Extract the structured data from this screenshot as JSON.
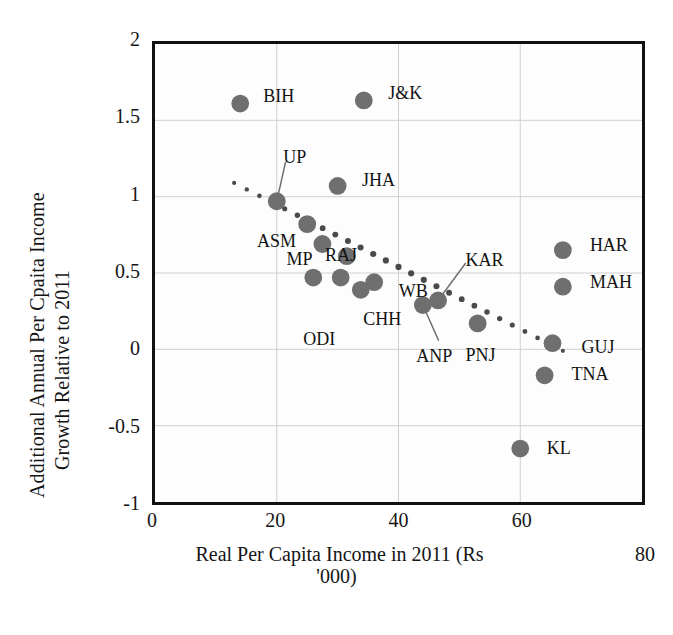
{
  "chart_data": {
    "type": "scatter",
    "title": "",
    "xlabel": "Real Per Capita Income in 2011 (Rs '000)",
    "xlabel_line1": "Real Per Capita Income in 2011 (Rs",
    "xlabel_line2": "'000)",
    "ylabel": "Additional Annual Per Cpaita Income Growth Relative to 2011",
    "ylabel_line1": "Additional Annual Per Cpaita Income",
    "ylabel_line2": "Growth Relative to 2011",
    "xlim": [
      0,
      80
    ],
    "ylim": [
      -1,
      2
    ],
    "xticks": [
      0,
      20,
      40,
      60,
      80
    ],
    "xtick_labels": [
      "0",
      "20",
      "40",
      "60",
      "80"
    ],
    "yticks": [
      -1,
      -0.5,
      0,
      0.5,
      1,
      1.5,
      2
    ],
    "ytick_labels": [
      "-1",
      "-0.5",
      "0",
      "0.5",
      "1",
      "1.5",
      "2"
    ],
    "grid": true,
    "legend": "none",
    "marker_color": "#6f6f6f",
    "trendline_color": "#4a4a4a",
    "trendline_style": "dotted",
    "trendline": {
      "x0": 13.0,
      "y0": 1.09,
      "x1": 67.0,
      "y1": -0.01
    },
    "points": [
      {
        "label": "BIH",
        "x": 14.0,
        "y": 1.61,
        "label_dx": 22,
        "label_dy": -8,
        "leader": false
      },
      {
        "label": "J&K",
        "x": 34.3,
        "y": 1.63,
        "label_dx": 22,
        "label_dy": -8,
        "leader": false
      },
      {
        "label": "UP",
        "x": 20.0,
        "y": 0.97,
        "label_dx": 5,
        "label_dy": -46,
        "leader": true
      },
      {
        "label": "JHA",
        "x": 30.0,
        "y": 1.07,
        "label_dx": 22,
        "label_dy": -8,
        "leader": false
      },
      {
        "label": "ASM",
        "x": 25.0,
        "y": 0.82,
        "label_dx": -52,
        "label_dy": 14,
        "leader": false
      },
      {
        "label": "MP",
        "x": 27.5,
        "y": 0.69,
        "label_dx": -38,
        "label_dy": 12,
        "leader": false
      },
      {
        "label": "RAJ",
        "x": 31.5,
        "y": 0.61,
        "label_dx": -24,
        "label_dy": -4,
        "leader": false
      },
      {
        "label": "ODI",
        "x": 26.0,
        "y": 0.47,
        "label_dx": -12,
        "label_dy": 58,
        "leader": false
      },
      {
        "label": "ODI2",
        "x": 30.5,
        "y": 0.47,
        "label_dx": -38,
        "label_dy": 46,
        "leader": true
      },
      {
        "label": "CHH",
        "x": 33.8,
        "y": 0.39,
        "label_dx": 0,
        "label_dy": 26,
        "leader": false
      },
      {
        "label": "WB",
        "x": 36.0,
        "y": 0.44,
        "label_dx": 22,
        "label_dy": 6,
        "leader": false
      },
      {
        "label": "ANP",
        "x": 44.0,
        "y": 0.29,
        "label_dx": -10,
        "label_dy": 48,
        "leader": true
      },
      {
        "label": "KAR",
        "x": 46.5,
        "y": 0.32,
        "label_dx": 24,
        "label_dy": -44,
        "leader": true
      },
      {
        "label": "PNJ",
        "x": 53.0,
        "y": 0.17,
        "label_dx": -16,
        "label_dy": 28,
        "leader": false
      },
      {
        "label": "GUJ",
        "x": 65.3,
        "y": 0.04,
        "label_dx": 24,
        "label_dy": 0,
        "leader": false
      },
      {
        "label": "TNA",
        "x": 64.0,
        "y": -0.17,
        "label_dx": 22,
        "label_dy": -6,
        "leader": false
      },
      {
        "label": "KL",
        "x": 60.0,
        "y": -0.65,
        "label_dx": 22,
        "label_dy": -6,
        "leader": false
      },
      {
        "label": "HAR",
        "x": 67.0,
        "y": 0.65,
        "label_dx": 22,
        "label_dy": -8,
        "leader": false
      },
      {
        "label": "MAH",
        "x": 67.0,
        "y": 0.41,
        "label_dx": 22,
        "label_dy": -8,
        "leader": false
      }
    ]
  }
}
